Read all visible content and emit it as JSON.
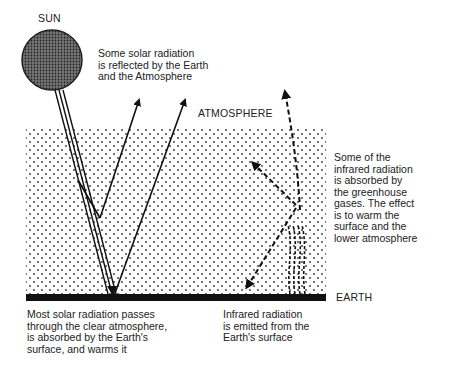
{
  "diagram": {
    "labels": {
      "sun": "SUN",
      "atmosphere": "ATMOSPHERE",
      "earth": "EARTH"
    },
    "annotations": {
      "reflected": "Some solar radiation\nis reflected by the Earth\nand the Atmosphere",
      "absorbed_infrared": "Some of the\ninfrared radiation\nis absorbed by\nthe greenhouse\ngases. The effect\nis to warm the\nsurface and the\nlower atmosphere",
      "solar_passes": "Most solar radiation passes\nthrough the clear atmosphere,\nis absorbed by the Earth's\nsurface, and warms it",
      "infrared_emitted": "Infrared radiation\nis emitted from the\nEarth's surface"
    },
    "colors": {
      "ink": "#111111",
      "background": "#ffffff",
      "sun_fill": "#555555"
    }
  }
}
